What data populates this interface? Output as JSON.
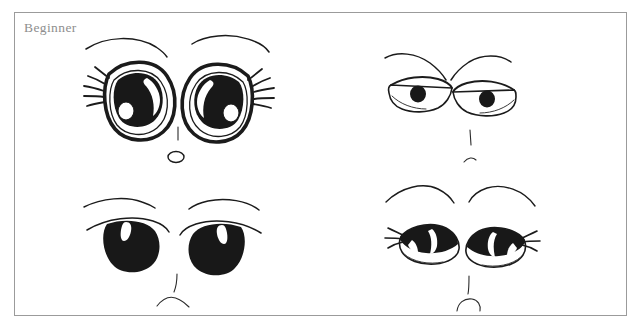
{
  "page": {
    "background_color": "#ffffff",
    "width": 641,
    "height": 331
  },
  "frame": {
    "border_color": "#9b9b9b",
    "fill_color": "#ffffff"
  },
  "label": {
    "text": "Beginner",
    "color": "#8e8e8e"
  },
  "artwork": {
    "title": "Beginner",
    "medium": "hand-drawn pen sketch",
    "subject": "anime eye expression reference sheet",
    "ink_color": "#181818",
    "layout": "2 x 2 grid of eye pairs",
    "panels": [
      {
        "id": "panel-top-left",
        "position": "top-left",
        "style_name": "large round sparkling eyes",
        "expression": "surprised / innocent",
        "features": [
          "arched thin eyebrows",
          "large oval eyes with thick outline",
          "big black iris filling most of the eye",
          "crescent white highlight upper area",
          "small round white highlight lower-left of iris",
          "eyelashes fanning from outer corners",
          "short vertical nose line",
          "small open oval mouth"
        ],
        "eye_shape": "tall oval",
        "pupil_size": "very large",
        "lash_count": 5
      },
      {
        "id": "panel-top-right",
        "position": "top-right",
        "style_name": "narrow angular eyes",
        "expression": "serious / stern",
        "features": [
          "straight slanted eyebrows",
          "narrow angular almond eye outline",
          "small round black pupil",
          "heavy upper lid line",
          "short vertical nose line",
          "small curved mouth"
        ],
        "eye_shape": "narrow angular",
        "pupil_size": "small",
        "lash_count": 0
      },
      {
        "id": "panel-bottom-left",
        "position": "bottom-left",
        "style_name": "solid black rounded eyes",
        "expression": "calm / sad",
        "features": [
          "thin flat eyebrows",
          "thin arched eyelid line over each eye",
          "solid black rounded eye mass",
          "thin vertical white highlight near upper-left",
          "short vertical nose line",
          "small upward curved mouth"
        ],
        "eye_shape": "rounded blob",
        "pupil_size": "full fill",
        "lash_count": 0
      },
      {
        "id": "panel-bottom-right",
        "position": "bottom-right",
        "style_name": "half-lidded lashed eyes",
        "expression": "sleepy / bored",
        "features": [
          "high arched thin eyebrows",
          "heavy black upper lid covering top half of eye",
          "angled white highlight slashes in the black mass",
          "white lower eye area",
          "three lashes at outer corners",
          "short vertical nose line",
          "small open curved mouth"
        ],
        "eye_shape": "half-closed oval",
        "pupil_size": "partially hidden",
        "lash_count": 3
      }
    ]
  }
}
